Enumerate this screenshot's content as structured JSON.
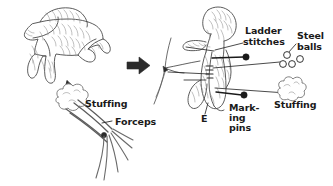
{
  "figure": {
    "background": "#ffffff",
    "ink": "#3a3a3a",
    "text_color": "#1a1a1a",
    "width": 333,
    "height": 186
  },
  "panels": {
    "left": {
      "name": "pre-stuffing-panel",
      "subject": "stuffed-animal-figure",
      "labels": {
        "stuffing": "Stuffing",
        "forceps": "Forceps"
      }
    },
    "arrow": {
      "name": "process-arrow",
      "direction": "right",
      "color": "#2b2b2b"
    },
    "right": {
      "name": "post-stuffing-panel",
      "subject": "stuffed-animal-figure-vertical",
      "labels": {
        "ladder_stitches_line1": "Ladder",
        "ladder_stitches_line2": "stitches",
        "steel_balls_line1": "Steel",
        "steel_balls_line2": "balls",
        "marking_pins_line1": "Mark-",
        "marking_pins_line2": "ing",
        "marking_pins_line3": "pins",
        "stuffing": "Stuffing",
        "needle": "E"
      },
      "steel_ball_count": 4
    }
  }
}
